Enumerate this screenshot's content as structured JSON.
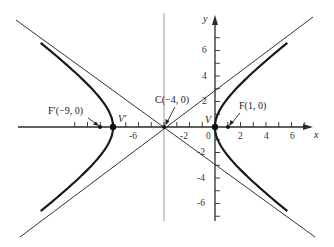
{
  "diagram": {
    "equation": "(x+4)^2/16 - y^2/9 = 1",
    "colors": {
      "curve": "#1a1a1a",
      "axis": "#2a2a2a",
      "asymptote": "#333333",
      "center_line": "#9a9a9a",
      "text": "#222222"
    },
    "axes": {
      "x_label": "x",
      "y_label": "y",
      "x_ticks": [
        "-6",
        "-2",
        "0",
        "2",
        "4",
        "6"
      ],
      "y_ticks": [
        "6",
        "4",
        "2",
        "-2",
        "-4",
        "-6"
      ]
    },
    "points": {
      "center": "C(−4, 0)",
      "focus_right": "F(1, 0)",
      "focus_left": "F′(−9, 0)",
      "vertex_right": "V",
      "vertex_left": "V′"
    },
    "params": {
      "a": 4,
      "b": 3,
      "c": 5,
      "h": -4,
      "k": 0
    }
  }
}
